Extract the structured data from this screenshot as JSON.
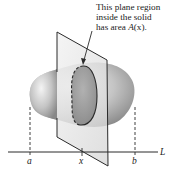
{
  "diagram": {
    "caption_lines": [
      "This plane region",
      "inside the solid",
      "has area A(x)."
    ],
    "caption_line3_prefix": "has area ",
    "caption_function": "A",
    "caption_arg": "(x).",
    "axis_name": "L",
    "labels": {
      "a": "a",
      "x": "x",
      "b": "b"
    },
    "colors": {
      "line": "#2a2a2a",
      "solid_light": "#f2f2f2",
      "solid_mid": "#b9b9b9",
      "solid_dark": "#7d7d7d",
      "plane": "#e6e6e6",
      "cross_section": "#8c8c8c"
    }
  }
}
